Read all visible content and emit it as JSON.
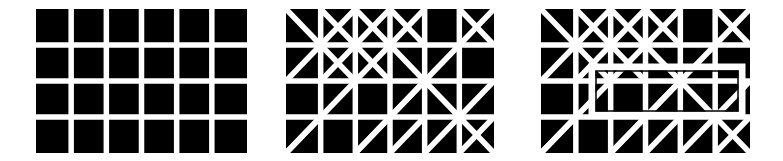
{
  "figure": {
    "background": "#ffffff",
    "cell_color": "#000000",
    "line_color": "#ffffff",
    "rows": 4,
    "cols": 6,
    "panels": [
      {
        "id": "plain-grid",
        "x": 36,
        "y": 9,
        "width": 211,
        "height": 144,
        "diagonals": [],
        "overlay": null
      },
      {
        "id": "diagonal-grid",
        "x": 286,
        "y": 9,
        "width": 208,
        "height": 144,
        "diagonals": [
          [
            0,
            0,
            2,
            2
          ],
          [
            0,
            2,
            2,
            0
          ],
          [
            1,
            2,
            3,
            0
          ],
          [
            0,
            4,
            2,
            2
          ],
          [
            2,
            2,
            4,
            0
          ],
          [
            2,
            0,
            4,
            2
          ],
          [
            2,
            4,
            4,
            2
          ],
          [
            4,
            2,
            6,
            0
          ],
          [
            1,
            0,
            3,
            2
          ],
          [
            3,
            0,
            4,
            1
          ],
          [
            5,
            0,
            6,
            1
          ],
          [
            0,
            4,
            1,
            3
          ],
          [
            5,
            4,
            6,
            3
          ],
          [
            2,
            4,
            4,
            2
          ],
          [
            4,
            2,
            6,
            4
          ],
          [
            6,
            2,
            4,
            4
          ],
          [
            3,
            4,
            4,
            3
          ]
        ],
        "overlay": null
      },
      {
        "id": "diagonal-grid-with-rectangle",
        "x": 541,
        "y": 9,
        "width": 209,
        "height": 144,
        "diagonals": [
          [
            0,
            0,
            2,
            2
          ],
          [
            0,
            2,
            2,
            0
          ],
          [
            1,
            2,
            3,
            0
          ],
          [
            0,
            4,
            2,
            2
          ],
          [
            2,
            2,
            4,
            0
          ],
          [
            2,
            0,
            4,
            2
          ],
          [
            2,
            4,
            4,
            2
          ],
          [
            4,
            2,
            6,
            0
          ],
          [
            1,
            0,
            3,
            2
          ],
          [
            3,
            0,
            4,
            1
          ],
          [
            5,
            0,
            6,
            1
          ],
          [
            0,
            4,
            1,
            3
          ],
          [
            5,
            4,
            6,
            3
          ],
          [
            2,
            4,
            4,
            2
          ],
          [
            4,
            2,
            6,
            4
          ],
          [
            6,
            2,
            4,
            4
          ],
          [
            3,
            4,
            4,
            3
          ]
        ],
        "overlay": {
          "shape": "rectangle-outline",
          "x": 592,
          "y": 67,
          "width": 150,
          "height": 48,
          "stroke": "#ffffff",
          "stroke_width": 7
        }
      }
    ]
  }
}
